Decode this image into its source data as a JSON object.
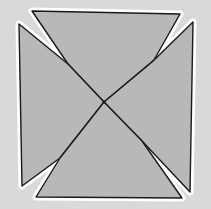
{
  "diagram": {
    "width": 211,
    "height": 209,
    "background": "#d9d9d9",
    "fill": "#b8b8b8",
    "halo": "#ffffff",
    "stroke": "#1a1a1a",
    "center": [
      104,
      102
    ],
    "pieces": [
      {
        "name": "top-triangle",
        "points": [
          [
            32,
            11
          ],
          [
            180,
            14
          ],
          [
            154,
            60
          ],
          [
            104,
            102
          ],
          [
            68,
            64
          ]
        ]
      },
      {
        "name": "left-triangle",
        "points": [
          [
            19,
            24
          ],
          [
            68,
            64
          ],
          [
            104,
            102
          ],
          [
            60,
            158
          ],
          [
            22,
            186
          ]
        ]
      },
      {
        "name": "right-triangle",
        "points": [
          [
            193,
            22
          ],
          [
            190,
            192
          ],
          [
            142,
            141
          ],
          [
            104,
            102
          ],
          [
            152,
            62
          ]
        ]
      },
      {
        "name": "bottom-triangle",
        "points": [
          [
            36,
            197
          ],
          [
            60,
            158
          ],
          [
            104,
            102
          ],
          [
            142,
            141
          ],
          [
            182,
            198
          ]
        ]
      }
    ],
    "lines": [
      {
        "name": "diagonal-a",
        "from": [
          32,
          11
        ],
        "to": [
          182,
          198
        ]
      },
      {
        "name": "diagonal-b",
        "from": [
          193,
          22
        ],
        "to": [
          36,
          197
        ]
      }
    ]
  }
}
